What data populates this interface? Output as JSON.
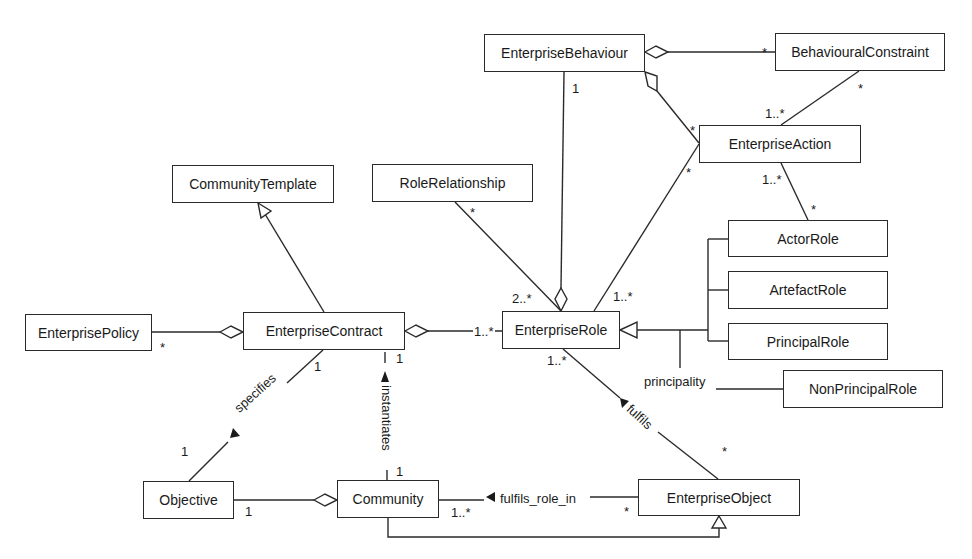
{
  "classes": {
    "enterprise_behaviour": "EnterpriseBehaviour",
    "behavioural_constraint": "BehaviouralConstraint",
    "enterprise_action": "EnterpriseAction",
    "community_template": "CommunityTemplate",
    "role_relationship": "RoleRelationship",
    "enterprise_policy": "EnterprisePolicy",
    "enterprise_contract": "EnterpriseContract",
    "enterprise_role": "EnterpriseRole",
    "actor_role": "ActorRole",
    "artefact_role": "ArtefactRole",
    "principal_role": "PrincipalRole",
    "non_principal_role": "NonPrincipalRole",
    "objective": "Objective",
    "community": "Community",
    "enterprise_object": "EnterpriseObject"
  },
  "association_labels": {
    "specifies": "specifies",
    "instantiates": "instantiates",
    "fulfils": "fulfils",
    "fulfils_role_in": "fulfils_role_in",
    "principality": "principality"
  },
  "multiplicities": {
    "behaviour_constraint_end": "*",
    "behaviour_role_end": "1",
    "behaviour_action_end": "*",
    "constraint_action_constraint_end": "*",
    "constraint_action_action_end": "1..*",
    "action_role_action_end": "*",
    "action_role_role_end": "1..*",
    "action_actor_action_end": "1..*",
    "action_actor_actor_end": "*",
    "rolerel_rolerel_end": "*",
    "rolerel_role_end": "2..*",
    "policy_end": "*",
    "contract_role_end": "1..*",
    "contract_specifies_end": "1",
    "objective_specifies_end": "1",
    "contract_instantiates_end": "1",
    "community_instantiates_end": "1",
    "objective_community_end": "1",
    "role_fulfils_end": "1..*",
    "object_fulfils_end": "*",
    "community_fulfils_role_in_end": "1..*",
    "object_fulfils_role_in_end": "*"
  },
  "colors": {
    "line": "#2a2a2a",
    "background": "#ffffff"
  }
}
